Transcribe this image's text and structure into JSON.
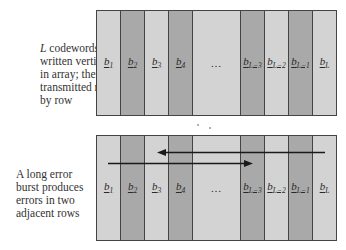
{
  "top_panel": {
    "caption_lines": [
      "codewords",
      "written vertically",
      "in array; then",
      "transmitted row",
      "by row"
    ],
    "caption_italic_prefix": "L",
    "columns": [
      {
        "label": "b",
        "sub": "1",
        "shade": "light"
      },
      {
        "label": "b",
        "sub": "2",
        "shade": "dark"
      },
      {
        "label": "b",
        "sub": "3",
        "shade": "light"
      },
      {
        "label": "b",
        "sub": "4",
        "shade": "dark"
      },
      {
        "label": "…",
        "sub": "",
        "shade": "light"
      },
      {
        "label": "b",
        "sub": "L−3",
        "shade": "dark"
      },
      {
        "label": "b",
        "sub": "L−2",
        "shade": "light"
      },
      {
        "label": "b",
        "sub": "L−1",
        "shade": "dark"
      },
      {
        "label": "b",
        "sub": "L",
        "shade": "light"
      }
    ]
  },
  "bottom_panel": {
    "caption_lines": [
      "A long error",
      "burst produces",
      "errors in two",
      "adjacent rows"
    ],
    "columns": [
      {
        "label": "b",
        "sub": "1",
        "shade": "light"
      },
      {
        "label": "b",
        "sub": "2",
        "shade": "dark"
      },
      {
        "label": "b",
        "sub": "3",
        "shade": "light"
      },
      {
        "label": "b",
        "sub": "4",
        "shade": "dark"
      },
      {
        "label": "…",
        "sub": "",
        "shade": "light"
      },
      {
        "label": "b",
        "sub": "L−3",
        "shade": "dark"
      },
      {
        "label": "b",
        "sub": "L−2",
        "shade": "light"
      },
      {
        "label": "b",
        "sub": "L−1",
        "shade": "dark"
      },
      {
        "label": "b",
        "sub": "L",
        "shade": "light"
      }
    ],
    "arrows": [
      {
        "name": "burst-row-upper",
        "direction": "left"
      },
      {
        "name": "burst-row-lower",
        "direction": "right"
      }
    ]
  },
  "colors": {
    "light": "#d3d3d3",
    "dark": "#a9a9a9",
    "border": "#444444",
    "arrow": "#1a1a1a"
  }
}
